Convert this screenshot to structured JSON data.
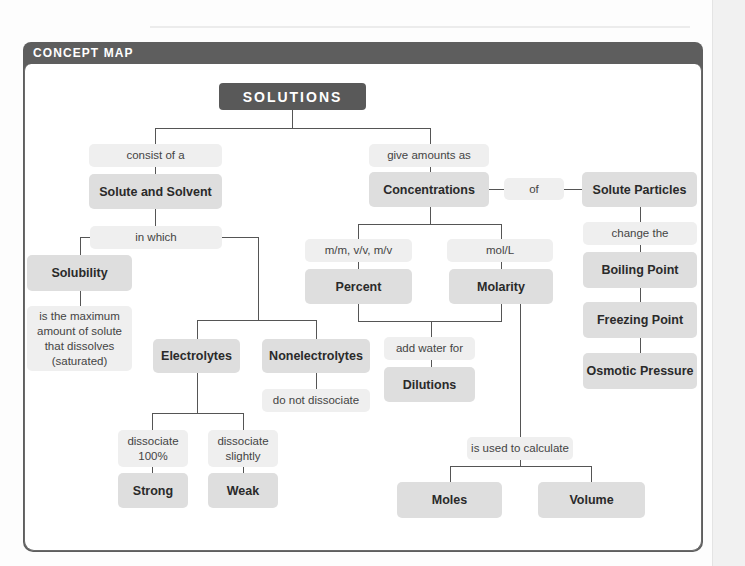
{
  "header": {
    "title": "CONCEPT MAP"
  },
  "colors": {
    "frame": "#5e5e5e",
    "root_node": "#595959",
    "concept_node": "#dedede",
    "link_node": "#efefef",
    "connector": "#555555"
  },
  "root": {
    "label": "SOLUTIONS"
  },
  "left_branch": {
    "link_consist": "consist of a",
    "solute_solvent": "Solute and Solvent",
    "link_in_which": "in which",
    "solubility": "Solubility",
    "solubility_def": "is the maximum amount of solute that dissolves (saturated)",
    "electrolytes": "Electrolytes",
    "nonelectrolytes": "Nonelectrolytes",
    "link_do_not": "do not dissociate",
    "link_100": "dissociate 100%",
    "link_slightly": "dissociate slightly",
    "strong": "Strong",
    "weak": "Weak"
  },
  "middle_branch": {
    "link_give": "give amounts as",
    "concentrations": "Concentrations",
    "link_of": "of",
    "link_percent_units": "m/m, v/v, m/v",
    "percent": "Percent",
    "link_molarity_units": "mol/L",
    "molarity": "Molarity",
    "link_add_water": "add water for",
    "dilutions": "Dilutions",
    "link_used_to": "is used to calculate",
    "moles": "Moles",
    "volume": "Volume"
  },
  "right_branch": {
    "solute_particles": "Solute Particles",
    "link_change": "change the",
    "boiling": "Boiling Point",
    "freezing": "Freezing Point",
    "osmotic": "Osmotic Pressure"
  }
}
